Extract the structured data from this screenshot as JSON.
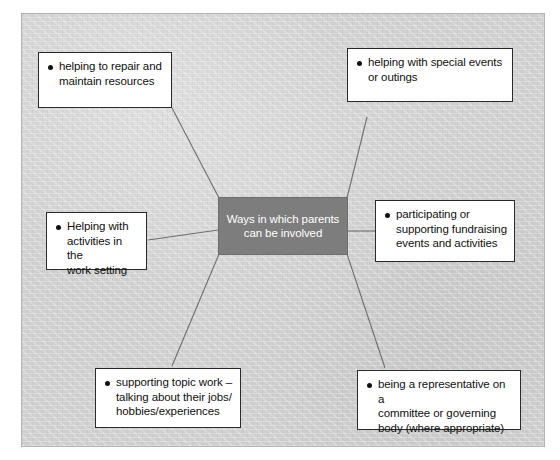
{
  "diagram": {
    "type": "spider-radial-mindmap",
    "center": {
      "label": "Ways in which parents\ncan be involved",
      "fill_color": "#7d7d7d",
      "text_color": "#ffffff"
    },
    "background_color": "#d3d3d3",
    "node_fill_color": "#ffffff",
    "node_border_color": "#2b2b2b",
    "connector_color": "#6e6e6e",
    "nodes": [
      {
        "id": "repair-resources",
        "label": "helping to repair and\nmaintain resources",
        "position": "top-left"
      },
      {
        "id": "special-events",
        "label": "helping with special events\nor outings",
        "position": "top-right"
      },
      {
        "id": "work-setting-activities",
        "label": "Helping with\nactivities in the\nwork setting",
        "position": "left"
      },
      {
        "id": "fundraising",
        "label": "participating or\nsupporting fundraising\nevents and activities",
        "position": "right"
      },
      {
        "id": "topic-work",
        "label": "supporting topic work –\ntalking about their jobs/\nhobbies/experiences",
        "position": "bottom-left"
      },
      {
        "id": "committee-representative",
        "label": "being a representative on a\ncommittee or governing\nbody (where appropriate)",
        "position": "bottom-right"
      }
    ]
  }
}
